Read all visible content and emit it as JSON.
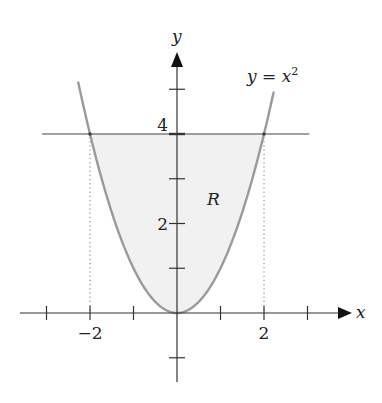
{
  "diagram": {
    "type": "region-between-curves",
    "curve": {
      "equation": "y = x^2",
      "label_parts": {
        "lhs": "y",
        "eq": " = ",
        "var": "x",
        "exp": "2"
      },
      "x_min": -2.27,
      "x_max": 2.22,
      "stroke": "#9a9a9a"
    },
    "horizontal_line": {
      "y": 4,
      "x_from": -3.1,
      "x_to": 3.04,
      "stroke": "#444444"
    },
    "region": {
      "label": "R",
      "fill": "#f1f1f1",
      "bounds": "x^2 <= y <= 4"
    },
    "intersections": [
      {
        "x": -2,
        "y": 4
      },
      {
        "x": 2,
        "y": 4
      }
    ],
    "dotted_guides": [
      {
        "x": -2,
        "from_y": 4,
        "to_y": 0
      },
      {
        "x": 2,
        "from_y": 4,
        "to_y": 0
      }
    ],
    "axes": {
      "x_label": "x",
      "y_label": "y",
      "x_ticks": [
        -3,
        -2,
        -1,
        1,
        2,
        3
      ],
      "y_ticks": [
        -1,
        1,
        2,
        3,
        4,
        5
      ],
      "x_tick_labels": [
        {
          "value": -2,
          "text": "−2"
        },
        {
          "value": 2,
          "text": "2"
        }
      ],
      "y_tick_labels": [
        {
          "value": 2,
          "text": "2"
        },
        {
          "value": 4,
          "text": "4"
        }
      ],
      "x_range": [
        -3.6,
        4.0
      ],
      "y_range": [
        -1.55,
        5.8
      ]
    },
    "mapping": {
      "origin_px": [
        177,
        313
      ],
      "px_per_unit_x": 43.5,
      "px_per_unit_y": 44.75
    },
    "colors": {
      "axis": "#333333",
      "text": "#222222",
      "fill": "#f1f1f1",
      "curve": "#9a9a9a"
    }
  }
}
